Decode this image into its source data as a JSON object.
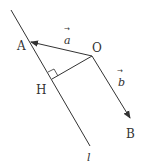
{
  "diagram": {
    "points": {
      "A": {
        "label": "A",
        "x": 30,
        "y": 42
      },
      "O": {
        "label": "O",
        "x": 92,
        "y": 56
      },
      "H": {
        "label": "H",
        "x": 52,
        "y": 79
      },
      "B": {
        "label": "B",
        "x": 130,
        "y": 118
      }
    },
    "line_l": {
      "label": "l",
      "x1": 11,
      "y1": 10,
      "x2": 90,
      "y2": 146
    },
    "vectors": {
      "a": {
        "label": "a",
        "arrow": "→",
        "from": "O",
        "to": "A"
      },
      "b": {
        "label": "b",
        "arrow": "→",
        "from": "O",
        "to": "B"
      }
    },
    "segment_OH": {
      "from": "O",
      "to": "H",
      "perpendicular_to": "l"
    },
    "colors": {
      "stroke": "#333333",
      "background": "#ffffff"
    }
  }
}
